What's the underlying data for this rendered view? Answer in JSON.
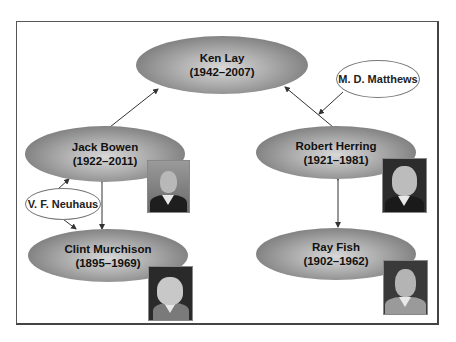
{
  "diagram": {
    "type": "relationship-network",
    "nodes": [
      {
        "id": "ken_lay",
        "name": "Ken Lay",
        "years": "(1942–2007)"
      },
      {
        "id": "jack_bowen",
        "name": "Jack Bowen",
        "years": "(1922–2011)"
      },
      {
        "id": "clint_murchison",
        "name": "Clint Murchison",
        "years": "(1895–1969)"
      },
      {
        "id": "robert_herring",
        "name": "Robert Herring",
        "years": "(1921–1981)"
      },
      {
        "id": "ray_fish",
        "name": "Ray Fish",
        "years": "(1902–1962)"
      }
    ],
    "annotations": [
      {
        "id": "neuhaus",
        "label": "V. F. Neuhaus",
        "points_to": "jack_bowen-clint_murchison"
      },
      {
        "id": "matthews",
        "label": "M. D. Matthews",
        "points_to": "ken_lay-robert_herring"
      }
    ],
    "edges": [
      {
        "from": "ken_lay",
        "to": "jack_bowen",
        "style": "double-arrow"
      },
      {
        "from": "ken_lay",
        "to": "robert_herring",
        "style": "arrow-to-ken_lay"
      },
      {
        "from": "jack_bowen",
        "to": "clint_murchison",
        "style": "double-arrow"
      },
      {
        "from": "robert_herring",
        "to": "ray_fish",
        "style": "double-arrow"
      }
    ],
    "photos": [
      {
        "of": "jack_bowen",
        "icon": "portrait-photo"
      },
      {
        "of": "clint_murchison",
        "icon": "portrait-photo"
      },
      {
        "of": "robert_herring",
        "icon": "portrait-photo"
      },
      {
        "of": "ray_fish",
        "icon": "portrait-photo"
      }
    ]
  },
  "colors": {
    "node_fill": "#8a8a8a",
    "node_highlight": "#d8d8d8",
    "line": "#333333",
    "frame": "#555555"
  }
}
